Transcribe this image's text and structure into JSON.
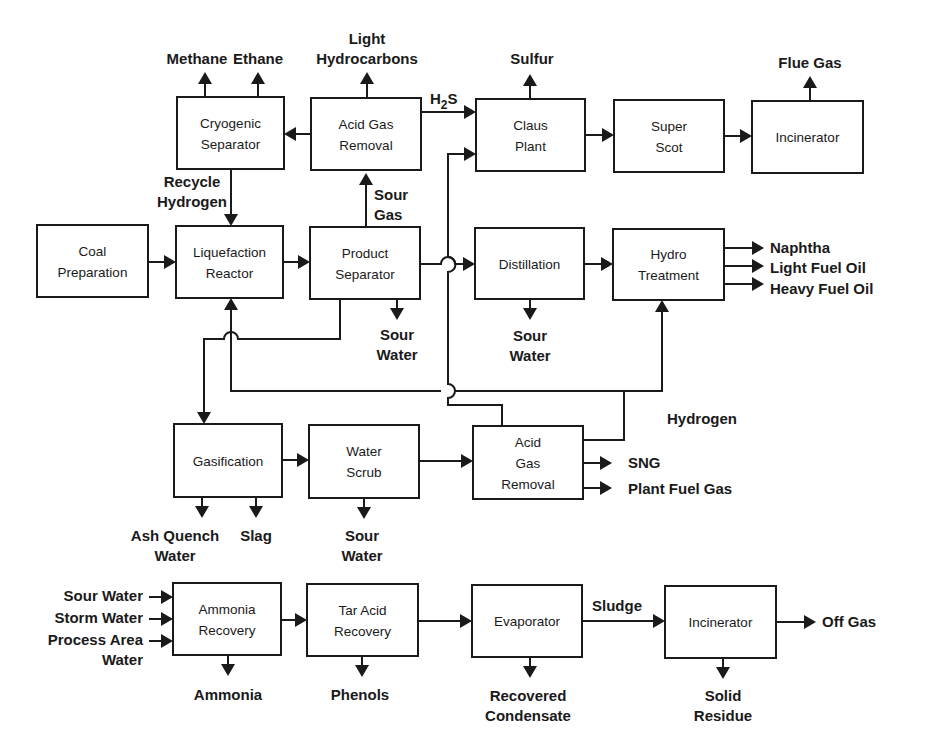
{
  "diagram": {
    "type": "process-flow",
    "boxes": {
      "cryogenic_separator": [
        "Cryogenic",
        "Separator"
      ],
      "acid_gas_removal_top": [
        "Acid Gas",
        "Removal"
      ],
      "claus_plant": [
        "Claus",
        "Plant"
      ],
      "super_scot": [
        "Super",
        "Scot"
      ],
      "incinerator_top": [
        "Incinerator"
      ],
      "coal_preparation": [
        "Coal",
        "Preparation"
      ],
      "liquefaction_reactor": [
        "Liquefaction",
        "Reactor"
      ],
      "product_separator": [
        "Product",
        "Separator"
      ],
      "distillation": [
        "Distillation"
      ],
      "hydro_treatment": [
        "Hydro",
        "Treatment"
      ],
      "gasification": [
        "Gasification"
      ],
      "water_scrub": [
        "Water",
        "Scrub"
      ],
      "acid_gas_removal_mid": [
        "Acid",
        "Gas",
        "Removal"
      ],
      "ammonia_recovery": [
        "Ammonia",
        "Recovery"
      ],
      "tar_acid_recovery": [
        "Tar Acid",
        "Recovery"
      ],
      "evaporator": [
        "Evaporator"
      ],
      "incinerator_bottom": [
        "Incinerator"
      ]
    },
    "labels": {
      "methane": [
        "Methane"
      ],
      "ethane": [
        "Ethane"
      ],
      "light_hydrocarbons": [
        "Light",
        "Hydrocarbons"
      ],
      "h2s": [
        "H",
        "2",
        "S"
      ],
      "sulfur": [
        "Sulfur"
      ],
      "flue_gas": [
        "Flue Gas"
      ],
      "recycle_hydrogen": [
        "Recycle",
        "Hydrogen"
      ],
      "sour_gas": [
        "Sour",
        "Gas"
      ],
      "sour_water_product": [
        "Sour",
        "Water"
      ],
      "sour_water_distillation": [
        "Sour",
        "Water"
      ],
      "naphtha": [
        "Naphtha"
      ],
      "light_fuel_oil": [
        "Light Fuel Oil"
      ],
      "heavy_fuel_oil": [
        "Heavy Fuel Oil"
      ],
      "hydrogen": [
        "Hydrogen"
      ],
      "sng": [
        "SNG"
      ],
      "plant_fuel_gas": [
        "Plant Fuel Gas"
      ],
      "ash_quench_water": [
        "Ash Quench",
        "Water"
      ],
      "slag": [
        "Slag"
      ],
      "sour_water_scrub": [
        "Sour",
        "Water"
      ],
      "sour_water_in": [
        "Sour Water"
      ],
      "storm_water_in": [
        "Storm Water"
      ],
      "process_area_water_in": [
        "Process Area",
        "Water"
      ],
      "ammonia": [
        "Ammonia"
      ],
      "phenols": [
        "Phenols"
      ],
      "recovered_condensate": [
        "Recovered",
        "Condensate"
      ],
      "sludge": [
        "Sludge"
      ],
      "off_gas": [
        "Off Gas"
      ],
      "solid_residue": [
        "Solid",
        "Residue"
      ]
    }
  }
}
